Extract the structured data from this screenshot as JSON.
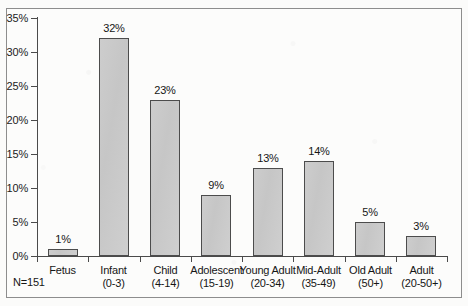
{
  "chart_data": {
    "type": "bar",
    "title": "",
    "subtitle": "",
    "xlabel": "",
    "ylabel": "",
    "ylim": [
      0,
      35
    ],
    "yticks": [
      0,
      5,
      10,
      15,
      20,
      25,
      30,
      35
    ],
    "ytick_labels": [
      "0%",
      "5%",
      "10%",
      "15%",
      "20%",
      "25%",
      "30%",
      "35%"
    ],
    "grid": false,
    "legend": null,
    "bar_fill_color": "#c9c9c9",
    "bar_edge_color": "#4c4c4c",
    "categories": [
      "Fetus",
      "Infant",
      "Child",
      "Adolescent",
      "Young Adult",
      "Mid-Adult",
      "Old Adult",
      "Adult"
    ],
    "category_ranges": [
      "",
      "(0-3)",
      "(4-14)",
      "(15-19)",
      "(20-34)",
      "(35-49)",
      "(50+)",
      "(20-50+)"
    ],
    "values": [
      1,
      32,
      23,
      9,
      13,
      14,
      5,
      3
    ],
    "value_labels": [
      "1%",
      "32%",
      "23%",
      "9%",
      "13%",
      "14%",
      "5%",
      "3%"
    ],
    "annotations": [
      {
        "name": "sample-size",
        "text": "N=151"
      }
    ]
  },
  "figure": {
    "sample_size_note": "N=151"
  }
}
